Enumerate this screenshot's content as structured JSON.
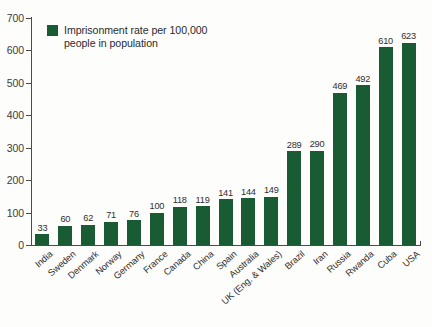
{
  "legend": {
    "label": "Imprisonment rate per 100,000 people in population",
    "swatch_color": "#195c34",
    "icon": "legend-swatch-icon"
  },
  "axis": {
    "y_ticks": [
      0,
      100,
      200,
      300,
      400,
      500,
      600,
      700
    ],
    "y_min": 0,
    "y_max": 700,
    "y_label": "",
    "x_label": ""
  },
  "chart_data": {
    "type": "bar",
    "title": "",
    "subtitle": "",
    "xlabel": "",
    "ylabel": "",
    "ylim": [
      0,
      700
    ],
    "grid": false,
    "legend_position": "top-left",
    "series_name": "Imprisonment rate per 100,000 people in population",
    "bar_color": "#195c34",
    "categories": [
      "India",
      "Sweden",
      "Denmark",
      "Norway",
      "Germany",
      "France",
      "Canada",
      "China",
      "Spain",
      "Australia",
      "UK (Eng. & Wales)",
      "Brazil",
      "Iran",
      "Russia",
      "Rwanda",
      "Cuba",
      "USA"
    ],
    "values": [
      33,
      60,
      62,
      71,
      76,
      100,
      118,
      119,
      141,
      144,
      149,
      289,
      290,
      469,
      492,
      610,
      623
    ],
    "data_labels": [
      "33",
      "60",
      "62",
      "71",
      "76",
      "100",
      "118",
      "119",
      "141",
      "144",
      "149",
      "289",
      "290",
      "469",
      "492",
      "610",
      "623"
    ],
    "tick_labels": [
      "0",
      "100",
      "200",
      "300",
      "400",
      "500",
      "600",
      "700"
    ]
  }
}
